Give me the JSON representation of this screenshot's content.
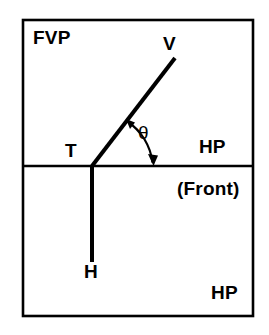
{
  "diagram": {
    "type": "descriptive-geometry-projection",
    "stroke_color": "#000000",
    "background_color": "#ffffff",
    "frame": {
      "x": 23,
      "y": 20,
      "width": 230,
      "height": 296,
      "stroke_width": 2.6
    },
    "divider": {
      "y": 166,
      "x1": 23,
      "x2": 253,
      "stroke_width": 2.6
    },
    "regions": [
      {
        "name": "upper-region",
        "label": "FVP"
      },
      {
        "name": "lower-region",
        "label": "HP"
      }
    ],
    "points": [
      {
        "name": "T",
        "label": "T",
        "x": 92,
        "y": 166
      },
      {
        "name": "V",
        "label": "V",
        "x": 175,
        "y": 58
      },
      {
        "name": "H",
        "label": "H",
        "x": 92,
        "y": 262
      }
    ],
    "lines": [
      {
        "name": "line-TV",
        "from": "T",
        "to": "V",
        "x1": 92,
        "y1": 166,
        "x2": 175,
        "y2": 58,
        "stroke_width": 4
      },
      {
        "name": "line-TH",
        "from": "T",
        "to": "H",
        "x1": 92,
        "y1": 166,
        "x2": 92,
        "y2": 262,
        "stroke_width": 4
      }
    ],
    "angle_arc": {
      "name": "angle-theta-arc",
      "symbol": "θ",
      "center_x": 92,
      "center_y": 166,
      "radius": 62,
      "from_x": 127,
      "from_y": 121,
      "to_x": 153,
      "to_y": 163,
      "double_headed": true,
      "stroke_width": 2.2
    },
    "labels": {
      "fvp": "FVP",
      "v": "V",
      "t": "T",
      "theta": "θ",
      "hp_front_line1": "HP",
      "hp_front_line2": "(Front)",
      "h": "H",
      "hp_bottom": "HP"
    }
  }
}
